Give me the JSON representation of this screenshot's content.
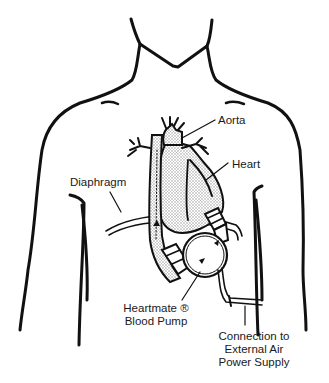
{
  "diagram": {
    "colors": {
      "line": "#111111",
      "background": "#ffffff",
      "stipple": "#bdbdbd"
    },
    "labels": {
      "aorta": "Aorta",
      "heart": "Heart",
      "diaphragm": "Diaphragm",
      "pump_line1": "Heartmate ®",
      "pump_line2": "Blood Pump",
      "supply_line1": "Connection to",
      "supply_line2": "External Air",
      "supply_line3": "Power Supply"
    }
  }
}
